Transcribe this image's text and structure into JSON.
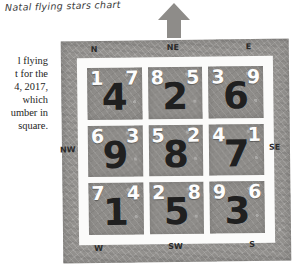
{
  "title": "Natal flying stars chart",
  "body_lines": [
    "l flying",
    "t for the",
    "4, 2017,",
    "which",
    "umber in",
    "square."
  ],
  "arrow": {
    "name": "north-arrow",
    "direction": "up",
    "color": "#8e8c89"
  },
  "compass": {
    "n": "N",
    "ne": "NE",
    "e": "E",
    "nw": "NW",
    "se": "SE",
    "w": "W",
    "sw": "SW",
    "s": "S"
  },
  "colors": {
    "frame": "#93918e",
    "cell": "#8e8c89",
    "mat": "#fbfbfa",
    "small_digit": "#fdfdfd",
    "large_digit": "#202020"
  },
  "grid": {
    "cells": [
      {
        "position": "N",
        "mountain": "1",
        "period": "4",
        "water": "7"
      },
      {
        "position": "NE",
        "mountain": "8",
        "period": "2",
        "water": "5"
      },
      {
        "position": "E",
        "mountain": "3",
        "period": "6",
        "water": "9"
      },
      {
        "position": "NW",
        "mountain": "6",
        "period": "9",
        "water": "3"
      },
      {
        "position": "C",
        "mountain": "5",
        "period": "8",
        "water": "2"
      },
      {
        "position": "SE",
        "mountain": "4",
        "period": "7",
        "water": "1"
      },
      {
        "position": "W",
        "mountain": "7",
        "period": "1",
        "water": "4"
      },
      {
        "position": "SW",
        "mountain": "2",
        "period": "5",
        "water": "8"
      },
      {
        "position": "S",
        "mountain": "9",
        "period": "3",
        "water": "6"
      }
    ]
  }
}
